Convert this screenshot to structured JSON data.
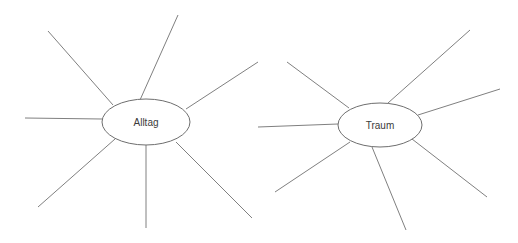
{
  "page": {
    "background_color": "#ffffff",
    "width": 518,
    "height": 243,
    "type": "mind-map-worksheet"
  },
  "style": {
    "line_color": "#808080",
    "ellipse_stroke_color": "#6e6e6e",
    "ellipse_fill_color": "#ffffff",
    "label_color": "#3b3b3b",
    "line_width": 1
  },
  "clusters": [
    {
      "id": "alltag",
      "label": "Alltag",
      "center": {
        "x": 146,
        "y": 122
      },
      "ellipse": {
        "rx": 44,
        "ry": 23
      },
      "spoke_count": 8,
      "spokes": [
        {
          "name": "spoke-up-left-far",
          "x1": 113,
          "y1": 105,
          "x2": 48,
          "y2": 31
        },
        {
          "name": "spoke-up-steep",
          "x1": 140,
          "y1": 100,
          "x2": 178,
          "y2": 15
        },
        {
          "name": "spoke-up-right",
          "x1": 186,
          "y1": 109,
          "x2": 258,
          "y2": 62
        },
        {
          "name": "spoke-left",
          "x1": 102,
          "y1": 119,
          "x2": 25,
          "y2": 118
        },
        {
          "name": "spoke-down-left",
          "x1": 115,
          "y1": 139,
          "x2": 38,
          "y2": 207
        },
        {
          "name": "spoke-down",
          "x1": 146,
          "y1": 145,
          "x2": 146,
          "y2": 228
        },
        {
          "name": "spoke-down-right",
          "x1": 176,
          "y1": 142,
          "x2": 252,
          "y2": 218
        }
      ]
    },
    {
      "id": "traum",
      "label": "Traum",
      "center": {
        "x": 380,
        "y": 125
      },
      "ellipse": {
        "rx": 42,
        "ry": 22
      },
      "spoke_count": 8,
      "spokes": [
        {
          "name": "spoke-up-left-far",
          "x1": 349,
          "y1": 108,
          "x2": 287,
          "y2": 62
        },
        {
          "name": "spoke-up-right-steep",
          "x1": 388,
          "y1": 103,
          "x2": 470,
          "y2": 30
        },
        {
          "name": "spoke-up-right",
          "x1": 418,
          "y1": 115,
          "x2": 500,
          "y2": 89
        },
        {
          "name": "spoke-left",
          "x1": 338,
          "y1": 124,
          "x2": 258,
          "y2": 127
        },
        {
          "name": "spoke-down-left",
          "x1": 350,
          "y1": 142,
          "x2": 275,
          "y2": 192
        },
        {
          "name": "spoke-down",
          "x1": 372,
          "y1": 147,
          "x2": 406,
          "y2": 230
        },
        {
          "name": "spoke-down-right",
          "x1": 412,
          "y1": 139,
          "x2": 487,
          "y2": 197
        }
      ]
    }
  ]
}
